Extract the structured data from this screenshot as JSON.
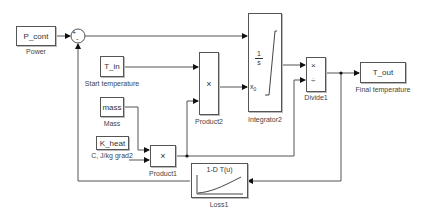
{
  "diagram": {
    "type": "simulink-block-diagram",
    "blocks": [
      {
        "id": "P_cont",
        "kind": "constant",
        "text": "P_cont",
        "label": "Power"
      },
      {
        "id": "Sum",
        "kind": "sum",
        "signs": [
          "+",
          "-"
        ]
      },
      {
        "id": "T_in",
        "kind": "constant",
        "text": "T_in",
        "label": "Start temperature"
      },
      {
        "id": "mass",
        "kind": "constant",
        "text": "mass",
        "label": "Mass"
      },
      {
        "id": "K_heat",
        "kind": "constant",
        "text": "K_heat",
        "label": "C, J/kg grad2"
      },
      {
        "id": "Product1",
        "kind": "product",
        "symbol": "×",
        "label": "Product1"
      },
      {
        "id": "Product2",
        "kind": "product",
        "symbol": "×",
        "label": "Product2"
      },
      {
        "id": "Integrator2",
        "kind": "integrator",
        "numerator": "1",
        "denominator": "s",
        "ic_port": "x0",
        "ic_sub": "0",
        "label": "Integrator2"
      },
      {
        "id": "Divide1",
        "kind": "divide",
        "ops": [
          "×",
          "÷"
        ],
        "label": "Divide1"
      },
      {
        "id": "T_out",
        "kind": "outport",
        "text": "T_out",
        "label": "Final temperature"
      },
      {
        "id": "Loss1",
        "kind": "lookup-1d",
        "text": "1-D T(u)",
        "label": "Loss1"
      }
    ],
    "connections": [
      {
        "from": "P_cont",
        "to": "Sum.in1"
      },
      {
        "from": "Sum",
        "to": "Integrator2.in1"
      },
      {
        "from": "T_in",
        "to": "Product2.in1"
      },
      {
        "from": "mass",
        "to": "Product1.in1"
      },
      {
        "from": "K_heat",
        "to": "Product1.in2"
      },
      {
        "from": "Product1",
        "to": "Product2.in2"
      },
      {
        "from": "Product1",
        "to": "Divide1.in2"
      },
      {
        "from": "Product2",
        "to": "Integrator2.x0"
      },
      {
        "from": "Integrator2",
        "to": "Divide1.in1"
      },
      {
        "from": "Divide1",
        "to": "T_out"
      },
      {
        "from": "Divide1",
        "to": "Loss1"
      },
      {
        "from": "Loss1",
        "to": "Sum.in2"
      }
    ]
  }
}
